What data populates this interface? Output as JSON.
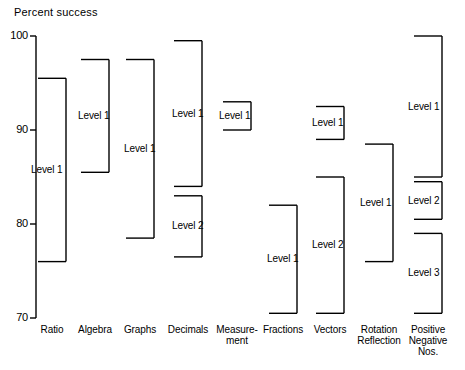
{
  "chart_data": {
    "type": "bar",
    "title": "Percent success",
    "xlabel": "",
    "ylabel": "Percent success",
    "ylim": [
      70,
      100
    ],
    "yticks": [
      100,
      90,
      80,
      70
    ],
    "ytick_labels": [
      "100",
      "90",
      "80",
      "70"
    ],
    "grid": false,
    "legend": null,
    "orientation": "vertical-range-brackets",
    "note": "Each category shows one or more vertical range brackets spanning the percent-success interval for a given level.",
    "categories": [
      "Ratio",
      "Algebra",
      "Graphs",
      "Decimals",
      "Measure-\nment",
      "Fractions",
      "Vectors",
      "Rotation\nReflection",
      "Positive\nNegative\nNos."
    ],
    "series": [
      {
        "category": "Ratio",
        "bars": [
          {
            "label": "Level 1",
            "high": 95.5,
            "low": 76.0
          }
        ]
      },
      {
        "category": "Algebra",
        "bars": [
          {
            "label": "Level 1",
            "high": 97.5,
            "low": 85.5
          }
        ]
      },
      {
        "category": "Graphs",
        "bars": [
          {
            "label": "Level 1",
            "high": 97.5,
            "low": 78.5
          }
        ]
      },
      {
        "category": "Decimals",
        "bars": [
          {
            "label": "Level 1",
            "high": 99.5,
            "low": 84.0
          },
          {
            "label": "Level 2",
            "high": 83.0,
            "low": 76.5
          }
        ]
      },
      {
        "category": "Measure-\nment",
        "bars": [
          {
            "label": "Level 1",
            "high": 93.0,
            "low": 90.0
          }
        ]
      },
      {
        "category": "Fractions",
        "bars": [
          {
            "label": "Level 1",
            "high": 82.0,
            "low": 70.5
          }
        ]
      },
      {
        "category": "Vectors",
        "bars": [
          {
            "label": "Level 1",
            "high": 92.5,
            "low": 89.0
          },
          {
            "label": "Level 2",
            "high": 85.0,
            "low": 70.5
          }
        ]
      },
      {
        "category": "Rotation\nReflection",
        "bars": [
          {
            "label": "Level 1",
            "high": 88.5,
            "low": 76.0
          }
        ]
      },
      {
        "category": "Positive\nNegative\nNos.",
        "bars": [
          {
            "label": "Level 1",
            "high": 100.0,
            "low": 85.0
          },
          {
            "label": "Level 2",
            "high": 84.5,
            "low": 80.5
          },
          {
            "label": "Level 3",
            "high": 79.0,
            "low": 70.5
          }
        ]
      }
    ],
    "colors": {
      "line": "#000000",
      "text": "#000000",
      "background": "#ffffff"
    }
  }
}
